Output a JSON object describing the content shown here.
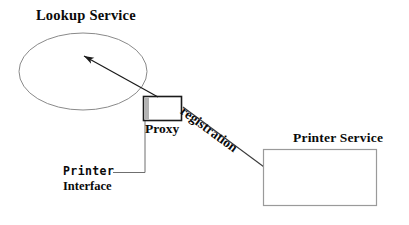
{
  "diagram": {
    "nodes": {
      "lookup_service": {
        "label": "Lookup Service",
        "shape": "ellipse",
        "cx": 83,
        "cy": 71.5,
        "rx": 64,
        "ry": 38.5,
        "stroke": "#8a8a8a",
        "fill": "#ffffff"
      },
      "proxy": {
        "label": "Proxy",
        "shape": "rect",
        "x": 143,
        "y": 96,
        "width": 39,
        "height": 25,
        "stroke": "#1a1a1a",
        "fill": "#ffffff",
        "left_bar_fill": "#b3b3b3",
        "left_bar_width": 5
      },
      "printer_service": {
        "label": "Printer Service",
        "shape": "rect",
        "x": 263,
        "y": 149,
        "width": 114,
        "height": 57,
        "stroke": "#9a9a9a",
        "fill": "#ffffff"
      }
    },
    "annotations": {
      "printer_interface": {
        "line1": "Printer",
        "line2": "Interface",
        "leader": {
          "from_x": 113,
          "from_y": 172,
          "corner_x": 145,
          "corner_y": 172,
          "to_x": 145,
          "to_y": 121,
          "stroke": "#6f6f6f"
        }
      }
    },
    "edges": [
      {
        "name": "proxy-to-lookup-arrow",
        "label": "",
        "from_x": 158,
        "from_y": 97,
        "to_x": 82,
        "to_y": 55,
        "stroke": "#1a1a1a",
        "arrowhead": "filled-triangle"
      },
      {
        "name": "proxy-to-printer-registration",
        "label": "registration",
        "from_x": 183,
        "from_y": 107,
        "to_x": 283,
        "to_y": 181,
        "stroke": "#3a3a3a",
        "arrowhead": "none",
        "label_rotation_deg": 36.5
      }
    ],
    "colors": {
      "ink": "#0a0a0a",
      "light_stroke": "#9a9a9a",
      "gray_fill": "#b3b3b3",
      "background": "#ffffff"
    }
  }
}
